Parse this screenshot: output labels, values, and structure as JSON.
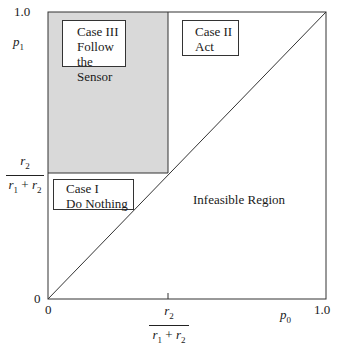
{
  "diagram": {
    "axes": {
      "x_label": "p0",
      "x_label_base": "p",
      "x_label_sub": "0",
      "y_label": "p1",
      "y_label_base": "p",
      "y_label_sub": "1",
      "x_ticks": [
        "0",
        "1.0"
      ],
      "y_ticks": [
        "0",
        "1.0"
      ],
      "threshold": {
        "numerator": "r2",
        "numerator_base": "r",
        "numerator_sub": "2",
        "denominator": "r1 + r2",
        "denominator_r1_base": "r",
        "denominator_r1_sub": "1",
        "denominator_plus": " + ",
        "denominator_r2_base": "r",
        "denominator_r2_sub": "2"
      }
    },
    "regions": [
      {
        "id": "case3",
        "line1": "Case III",
        "line2": "Follow the",
        "line3": "Sensor",
        "fill": "#d9d9d9"
      },
      {
        "id": "case2",
        "line1": "Case II",
        "line2": "Act"
      },
      {
        "id": "case1",
        "line1": "Case I",
        "line2": "Do Nothing"
      },
      {
        "id": "infeasible",
        "label": "Infeasible Region"
      }
    ],
    "colors": {
      "shade": "#d9d9d9",
      "line": "#333333"
    }
  }
}
